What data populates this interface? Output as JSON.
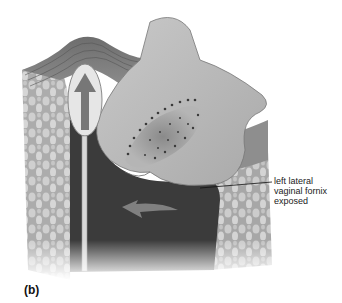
{
  "figure": {
    "panel_label": "(b)",
    "callout": {
      "lines": [
        "left lateral",
        "vaginal fornix",
        "exposed"
      ]
    },
    "elements": {
      "swab": "swab-with-upward-arrow",
      "cervix": "cervix-with-os",
      "rotation_arrow": "curved-arrow"
    },
    "colors": {
      "tissue_dark": "#3a3a3a",
      "tissue_mid": "#8a8a8a",
      "tissue_light": "#bdbdbd",
      "background": "#ffffff"
    }
  }
}
